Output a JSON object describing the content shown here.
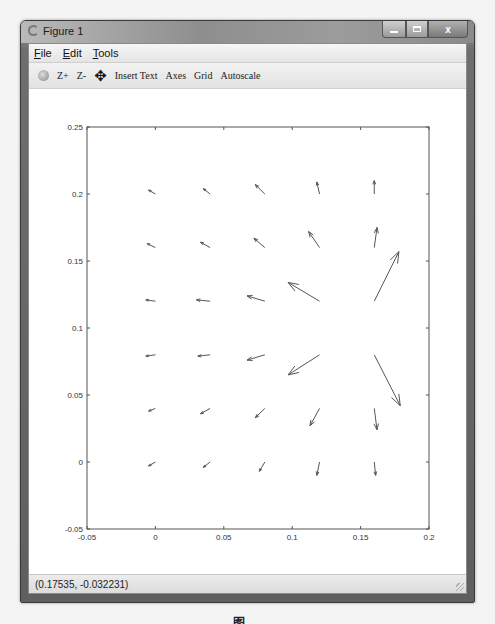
{
  "window": {
    "title": "Figure 1",
    "controls": {
      "minimize": "minimize",
      "maximize": "maximize",
      "close": "x"
    }
  },
  "menubar": {
    "items": [
      {
        "label": "File",
        "accel": "F",
        "rest": "ile"
      },
      {
        "label": "Edit",
        "accel": "E",
        "rest": "dit"
      },
      {
        "label": "Tools",
        "accel": "T",
        "rest": "ools"
      }
    ]
  },
  "toolbar": {
    "rotate_icon": "rotate-3d-icon",
    "zoom_in": "Z+",
    "zoom_out": "Z-",
    "pan_icon": "✥",
    "insert_text": "Insert Text",
    "axes": "Axes",
    "grid": "Grid",
    "autoscale": "Autoscale"
  },
  "statusbar": {
    "coordinates": "(0.17535, -0.032231)"
  },
  "caption": "图 …",
  "chart_data": {
    "type": "quiver",
    "title": "",
    "xlabel": "",
    "ylabel": "",
    "xlim": [
      -0.05,
      0.2
    ],
    "ylim": [
      -0.05,
      0.25
    ],
    "xticks": [
      "-0.05",
      "0",
      "0.05",
      "0.1",
      "0.15",
      "0.2"
    ],
    "yticks": [
      "-0.05",
      "0",
      "0.05",
      "0.1",
      "0.15",
      "0.2",
      "0.25"
    ],
    "xtick_values": [
      -0.05,
      0,
      0.05,
      0.1,
      0.15,
      0.2
    ],
    "ytick_values": [
      -0.05,
      0,
      0.05,
      0.1,
      0.15,
      0.2,
      0.25
    ],
    "grid": false,
    "legend": null,
    "grid_x": [
      0,
      0.04,
      0.08,
      0.12,
      0.16
    ],
    "grid_y": [
      0,
      0.04,
      0.08,
      0.12,
      0.16,
      0.2
    ],
    "arrow_color": "#555555",
    "arrows": [
      {
        "x": 0.0,
        "y": 0.2,
        "u": -0.005,
        "v": 0.003
      },
      {
        "x": 0.04,
        "y": 0.2,
        "u": -0.005,
        "v": 0.004
      },
      {
        "x": 0.08,
        "y": 0.2,
        "u": -0.007,
        "v": 0.007
      },
      {
        "x": 0.12,
        "y": 0.2,
        "u": -0.002,
        "v": 0.009
      },
      {
        "x": 0.16,
        "y": 0.2,
        "u": 0.0,
        "v": 0.01
      },
      {
        "x": 0.0,
        "y": 0.16,
        "u": -0.006,
        "v": 0.003
      },
      {
        "x": 0.04,
        "y": 0.16,
        "u": -0.007,
        "v": 0.004
      },
      {
        "x": 0.08,
        "y": 0.16,
        "u": -0.008,
        "v": 0.007
      },
      {
        "x": 0.12,
        "y": 0.16,
        "u": -0.008,
        "v": 0.012
      },
      {
        "x": 0.16,
        "y": 0.16,
        "u": 0.002,
        "v": 0.015
      },
      {
        "x": 0.0,
        "y": 0.12,
        "u": -0.007,
        "v": 0.001
      },
      {
        "x": 0.04,
        "y": 0.12,
        "u": -0.01,
        "v": 0.001
      },
      {
        "x": 0.08,
        "y": 0.12,
        "u": -0.013,
        "v": 0.004
      },
      {
        "x": 0.12,
        "y": 0.12,
        "u": -0.023,
        "v": 0.014
      },
      {
        "x": 0.16,
        "y": 0.12,
        "u": 0.018,
        "v": 0.037
      },
      {
        "x": 0.0,
        "y": 0.08,
        "u": -0.007,
        "v": -0.001
      },
      {
        "x": 0.04,
        "y": 0.08,
        "u": -0.009,
        "v": -0.001
      },
      {
        "x": 0.08,
        "y": 0.08,
        "u": -0.013,
        "v": -0.004
      },
      {
        "x": 0.12,
        "y": 0.08,
        "u": -0.023,
        "v": -0.015
      },
      {
        "x": 0.16,
        "y": 0.08,
        "u": 0.019,
        "v": -0.038
      },
      {
        "x": 0.0,
        "y": 0.04,
        "u": -0.005,
        "v": -0.002
      },
      {
        "x": 0.04,
        "y": 0.04,
        "u": -0.007,
        "v": -0.004
      },
      {
        "x": 0.08,
        "y": 0.04,
        "u": -0.007,
        "v": -0.007
      },
      {
        "x": 0.12,
        "y": 0.04,
        "u": -0.007,
        "v": -0.013
      },
      {
        "x": 0.16,
        "y": 0.04,
        "u": 0.002,
        "v": -0.016
      },
      {
        "x": 0.0,
        "y": 0.0,
        "u": -0.005,
        "v": -0.003
      },
      {
        "x": 0.04,
        "y": 0.0,
        "u": -0.005,
        "v": -0.004
      },
      {
        "x": 0.08,
        "y": 0.0,
        "u": -0.004,
        "v": -0.007
      },
      {
        "x": 0.12,
        "y": 0.0,
        "u": -0.002,
        "v": -0.01
      },
      {
        "x": 0.16,
        "y": 0.0,
        "u": 0.001,
        "v": -0.01
      }
    ]
  }
}
